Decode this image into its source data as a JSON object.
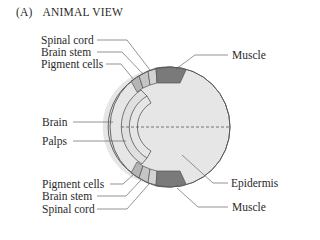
{
  "figure": {
    "panel_tag": "(A)",
    "title": "ANIMAL VIEW"
  },
  "labels": {
    "top_left": [
      "Spinal cord",
      "Brain stem",
      "Pigment cells"
    ],
    "middle_left": [
      "Brain",
      "Palps"
    ],
    "bottom_left": [
      "Pigment cells",
      "Brain stem",
      "Spinal cord"
    ],
    "top_right": "Muscle",
    "bottom_right": [
      "Epidermis",
      "Muscle"
    ]
  },
  "colors": {
    "outline": "#555555",
    "epidermis_fill": "#e6e6e6",
    "outer_band_fill": "#f4f4f4",
    "muscle_fill": "#7a7a7a",
    "pigment_fill": "#b5b5b5",
    "brainstem_fill": "#c9c9c9",
    "spinalcord_fill": "#d6d6d6",
    "palps_fill": "#dedede",
    "leader_line": "#666666"
  }
}
